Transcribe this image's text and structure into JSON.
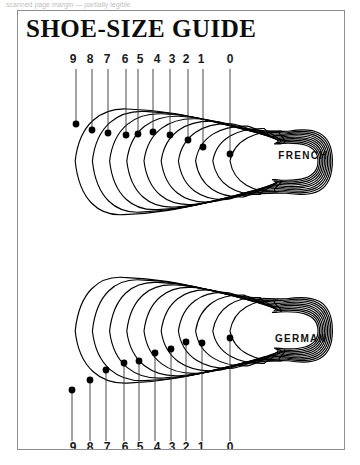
{
  "top_strip": {
    "text": "scanned page margin — partially legible"
  },
  "frame": {
    "title": "SHOE-SIZE GUIDE",
    "border_color": "#8e8e8e",
    "background": "#ffffff"
  },
  "chart_data": {
    "type": "diagram",
    "title": "SHOE-SIZE GUIDE",
    "grid": false,
    "legend": "none",
    "panels": [
      {
        "name": "FRENCH",
        "label": "FRENCH",
        "label_x": 285,
        "label_y": 148,
        "tick_side": "top",
        "tick_label_y": 52,
        "contour_count": 10,
        "categories": [
          "9",
          "8",
          "7",
          "6",
          "5",
          "4",
          "3",
          "2",
          "1",
          "0"
        ],
        "ticks": [
          {
            "label": "9",
            "label_x": 55,
            "line_top": 58,
            "dot_x": 58,
            "dot_y": 113
          },
          {
            "label": "8",
            "label_x": 72,
            "line_top": 58,
            "dot_x": 74,
            "dot_y": 119
          },
          {
            "label": "7",
            "label_x": 89,
            "line_top": 58,
            "dot_x": 90,
            "dot_y": 122
          },
          {
            "label": "6",
            "label_x": 107,
            "line_top": 58,
            "dot_x": 108,
            "dot_y": 124
          },
          {
            "label": "5",
            "label_x": 122,
            "line_top": 58,
            "dot_x": 120,
            "dot_y": 123
          },
          {
            "label": "4",
            "label_x": 139,
            "line_top": 58,
            "dot_x": 135,
            "dot_y": 121
          },
          {
            "label": "3",
            "label_x": 154,
            "line_top": 58,
            "dot_x": 152,
            "dot_y": 124
          },
          {
            "label": "2",
            "label_x": 168,
            "line_top": 58,
            "dot_x": 170,
            "dot_y": 129
          },
          {
            "label": "1",
            "label_x": 183,
            "line_top": 58,
            "dot_x": 185,
            "dot_y": 136
          },
          {
            "label": "0",
            "label_x": 212,
            "line_top": 58,
            "dot_x": 212,
            "dot_y": 143
          }
        ]
      },
      {
        "name": "GERMAN",
        "label": "GERMAN",
        "label_x": 283,
        "label_y": 331,
        "tick_side": "bottom",
        "tick_label_y": 440,
        "contour_count": 10,
        "categories": [
          "9",
          "8",
          "7",
          "6",
          "5",
          "4",
          "3",
          "2",
          "1",
          "0"
        ],
        "ticks": [
          {
            "label": "9",
            "label_x": 55,
            "line_bottom": 430,
            "dot_x": 54,
            "dot_y": 379
          },
          {
            "label": "8",
            "label_x": 72,
            "line_bottom": 430,
            "dot_x": 72,
            "dot_y": 369
          },
          {
            "label": "7",
            "label_x": 89,
            "line_bottom": 430,
            "dot_x": 88,
            "dot_y": 359
          },
          {
            "label": "6",
            "label_x": 107,
            "line_bottom": 430,
            "dot_x": 106,
            "dot_y": 352
          },
          {
            "label": "5",
            "label_x": 122,
            "line_bottom": 430,
            "dot_x": 121,
            "dot_y": 350
          },
          {
            "label": "4",
            "label_x": 139,
            "line_bottom": 430,
            "dot_x": 137,
            "dot_y": 342
          },
          {
            "label": "3",
            "label_x": 154,
            "line_bottom": 430,
            "dot_x": 153,
            "dot_y": 338
          },
          {
            "label": "2",
            "label_x": 168,
            "line_bottom": 430,
            "dot_x": 168,
            "dot_y": 331
          },
          {
            "label": "1",
            "label_x": 183,
            "line_bottom": 430,
            "dot_x": 184,
            "dot_y": 332
          },
          {
            "label": "0",
            "label_x": 212,
            "line_bottom": 430,
            "dot_x": 212,
            "dot_y": 327
          }
        ]
      }
    ],
    "colors": {
      "outline": "#000000",
      "leader": "#333333",
      "dot": "#000000",
      "text": "#111111"
    }
  }
}
